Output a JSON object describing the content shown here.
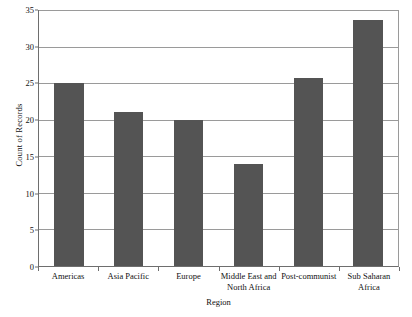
{
  "chart_data": {
    "type": "bar",
    "title": "",
    "xlabel": "Region",
    "ylabel": "Count of Records",
    "categories": [
      "Americas",
      "Asia Pacific",
      "Europe",
      "Middle East and North Africa",
      "Post-communist",
      "Sub Saharan Africa"
    ],
    "category_lines": [
      [
        "Americas",
        ""
      ],
      [
        "Asia Pacific",
        ""
      ],
      [
        "Europe",
        ""
      ],
      [
        "Middle East and",
        "North Africa"
      ],
      [
        "Post-communist",
        ""
      ],
      [
        "Sub Saharan Africa",
        ""
      ]
    ],
    "values": [
      25,
      21,
      20,
      14,
      25.7,
      33.7
    ],
    "ylim": [
      0,
      35
    ],
    "ytick_labels": [
      "0",
      "5",
      "10",
      "15",
      "20",
      "25",
      "30",
      "35"
    ],
    "ytick_values": [
      0,
      5,
      10,
      15,
      20,
      25,
      30,
      35
    ],
    "grid": true,
    "legend": "none",
    "bar_color": "#545454",
    "axis_color": "#6e6e6e",
    "gridline_color": "#9a9a9a",
    "background": "#ffffff"
  }
}
